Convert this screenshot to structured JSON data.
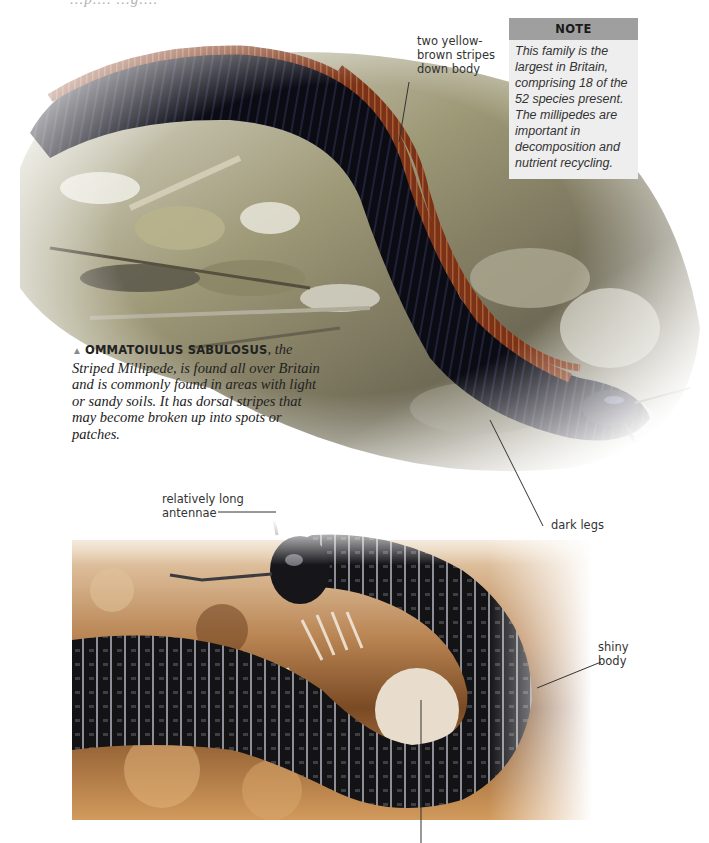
{
  "page": {
    "clipped_header_fragment": "...p.... ...g...."
  },
  "photos": {
    "top": {
      "subject": "Striped Millipede on leaf litter",
      "colors": {
        "body": "#0c0c16",
        "stripe": "#8a3a1c",
        "litter_light": "#d8d6c6",
        "litter_mid": "#8f8c6c",
        "litter_dark": "#3a352a"
      }
    },
    "bottom": {
      "subject": "Coiled black millipede on soil",
      "colors": {
        "body": "#111114",
        "highlight": "#d8d8d8",
        "soil": "#c8925a",
        "soil_dark": "#6a3e1e",
        "legs": "#efe6da"
      }
    }
  },
  "annotations": {
    "stripes": "two yellow-\nbrown stripes\ndown body",
    "dark_legs": "dark legs",
    "antennae": "relatively long\nantennae",
    "shiny_body": "shiny\nbody"
  },
  "note": {
    "heading": "NOTE",
    "body": "This family is the largest in Britain, comprising 18 of the 52 species present. The millipedes are important in decomposition and nutrient recycling."
  },
  "caption": {
    "marker": "▲",
    "species": "OMMATOIULUS SABULOSUS",
    "text": ", the Striped Millipede, is found all over Britain and is commonly found in areas with light or sandy soils. It has dorsal stripes that may become broken up into spots or patches."
  }
}
